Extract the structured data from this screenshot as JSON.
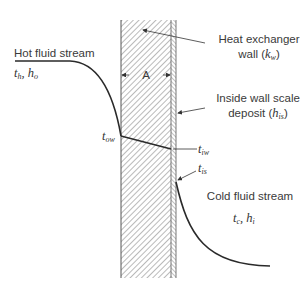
{
  "diagram": {
    "labels": {
      "hot_stream": "Hot fluid stream",
      "hot_vars": {
        "t": "t",
        "t_sub": "h",
        "h": "h",
        "h_sub": "o"
      },
      "wall": "Heat exchanger",
      "wall_line2_prefix": "wall (",
      "wall_var": "k",
      "wall_var_sub": "w",
      "wall_line2_suffix": ")",
      "deposit_line1": "Inside wall scale",
      "deposit_line2_prefix": "deposit (",
      "deposit_var": "h",
      "deposit_var_sub": "is",
      "deposit_line2_suffix": ")",
      "area": "A",
      "t_ow": {
        "t": "t",
        "sub": "ow"
      },
      "t_iw": {
        "t": "t",
        "sub": "iw"
      },
      "t_is": {
        "t": "t",
        "sub": "is"
      },
      "cold_stream": "Cold fluid stream",
      "cold_vars": {
        "t": "t",
        "t_sub": "c",
        "h": "h",
        "h_sub": "i"
      }
    },
    "colors": {
      "line": "#2a2a2a",
      "hatch": "#555555",
      "text": "#3a3a3a",
      "background": "#ffffff"
    }
  }
}
